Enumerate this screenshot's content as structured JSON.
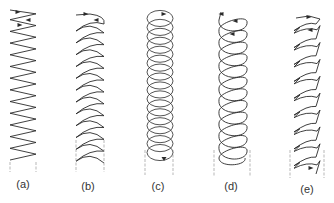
{
  "figure": {
    "stroke_color": "#2a2a2a",
    "guide_color": "#9a9a9a",
    "panels": [
      {
        "id": "a",
        "label": "(a)",
        "pattern": "zigzag",
        "cx": 23,
        "top": 8,
        "bottom": 160,
        "width": 26,
        "cycles": 13,
        "label_x": 23,
        "label_y": 178,
        "guides": [
          10,
          36
        ],
        "guide_top": 162,
        "guide_bottom": 172
      },
      {
        "id": "b",
        "label": "(b)",
        "pattern": "crescent",
        "cx": 90,
        "top": 18,
        "bottom": 160,
        "width": 28,
        "cycles": 12,
        "label_x": 88,
        "label_y": 180,
        "guides": [
          76,
          104
        ],
        "guide_top": 140,
        "guide_bottom": 172
      },
      {
        "id": "c",
        "label": "(c)",
        "pattern": "overlap-loops",
        "cx": 160,
        "top": 12,
        "bottom": 155,
        "width": 26,
        "cycles": 16,
        "label_x": 158,
        "label_y": 180,
        "guides": [
          145,
          173
        ],
        "guide_top": 150,
        "guide_bottom": 175
      },
      {
        "id": "d",
        "label": "(d)",
        "pattern": "spiral",
        "cx": 233,
        "top": 18,
        "bottom": 158,
        "width": 28,
        "cycles": 12,
        "label_x": 231,
        "label_y": 180,
        "guides": [
          214,
          250
        ],
        "guide_top": 150,
        "guide_bottom": 176
      },
      {
        "id": "e",
        "label": "(e)",
        "pattern": "jagged-crescent",
        "cx": 307,
        "top": 18,
        "bottom": 170,
        "width": 26,
        "cycles": 9,
        "label_x": 307,
        "label_y": 183,
        "guides": [
          290,
          324
        ],
        "guide_top": 150,
        "guide_bottom": 178
      }
    ]
  }
}
